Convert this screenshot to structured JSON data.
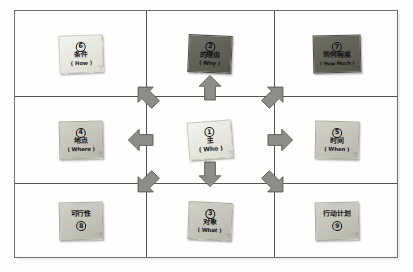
{
  "diagram": {
    "frame": {
      "border_color": "#6d6d6d",
      "background": "#fefefd"
    },
    "grid": {
      "rows": 3,
      "columns": 3,
      "line_color": "#555555"
    },
    "colors": {
      "note_light": "#e9e9e2",
      "note_mid": "#c2c2ba",
      "note_dark": "#5f5f57",
      "arrow_fill": "#8e8e88",
      "arrow_stroke": "#5a5a55",
      "line": "#555555"
    }
  },
  "notes": [
    {
      "id": "note-6",
      "number": "6",
      "zh": "条件",
      "en": "( How )",
      "tone": "light",
      "cell": "top-left"
    },
    {
      "id": "note-2",
      "number": "2",
      "zh": "的理由",
      "en": "( Why )",
      "tone": "dark",
      "cell": "top-center"
    },
    {
      "id": "note-7",
      "number": "7",
      "zh": "到何程度",
      "en": "( How Much )",
      "tone": "dark",
      "cell": "top-right"
    },
    {
      "id": "note-4",
      "number": "4",
      "zh": "地点",
      "en": "( Where )",
      "tone": "mid",
      "cell": "middle-left"
    },
    {
      "id": "note-1",
      "number": "1",
      "zh": "主",
      "en": "( Who )",
      "tone": "light",
      "cell": "middle-center"
    },
    {
      "id": "note-5",
      "number": "5",
      "zh": "时间",
      "en": "( When )",
      "tone": "mid",
      "cell": "middle-right"
    },
    {
      "id": "note-8",
      "number": "8",
      "zh": "可行性",
      "en": "",
      "tone": "mid",
      "cell": "bottom-left",
      "number_below": true
    },
    {
      "id": "note-3",
      "number": "3",
      "zh": "对象",
      "en": "( What )",
      "tone": "mid",
      "cell": "bottom-center"
    },
    {
      "id": "note-9",
      "number": "9",
      "zh": "行动计划",
      "en": "",
      "tone": "mid",
      "cell": "bottom-right",
      "number_below": true
    }
  ],
  "arrows": [
    {
      "id": "arrow-up-left",
      "direction": "up-left",
      "label": "arrow-up-left-icon"
    },
    {
      "id": "arrow-up",
      "direction": "up",
      "label": "arrow-up-icon"
    },
    {
      "id": "arrow-up-right",
      "direction": "up-right",
      "label": "arrow-up-right-icon"
    },
    {
      "id": "arrow-left",
      "direction": "left",
      "label": "arrow-left-icon"
    },
    {
      "id": "arrow-right",
      "direction": "right",
      "label": "arrow-right-icon"
    },
    {
      "id": "arrow-down-left",
      "direction": "down-left",
      "label": "arrow-down-left-icon"
    },
    {
      "id": "arrow-down",
      "direction": "down",
      "label": "arrow-down-icon"
    },
    {
      "id": "arrow-down-right",
      "direction": "down-right",
      "label": "arrow-down-right-icon"
    }
  ]
}
